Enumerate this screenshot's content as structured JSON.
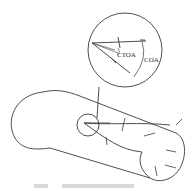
{
  "figure": {
    "labels": {
      "ctoa": "CTOA",
      "coa": "COA"
    },
    "caption_legible": false,
    "colors": {
      "stroke": "#3a3a3a",
      "caption": "#d8d8d8"
    }
  }
}
